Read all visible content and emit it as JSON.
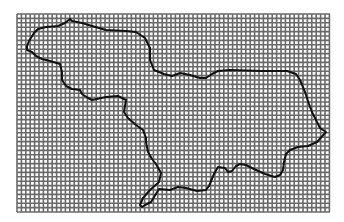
{
  "map": {
    "grid": {
      "x": 17,
      "y": 14,
      "width": 313,
      "height": 198,
      "cell": 4.4,
      "background": "#ffffff",
      "line_color": "#6a6a6a"
    },
    "region_outline": {
      "stroke": "#111111",
      "stroke_width": 2,
      "points": [
        [
          70,
          19
        ],
        [
          72,
          21
        ],
        [
          82,
          23
        ],
        [
          92,
          26
        ],
        [
          106,
          30
        ],
        [
          126,
          31
        ],
        [
          136,
          32
        ],
        [
          145,
          38
        ],
        [
          150,
          48
        ],
        [
          150,
          60
        ],
        [
          154,
          70
        ],
        [
          164,
          74
        ],
        [
          172,
          76
        ],
        [
          180,
          73
        ],
        [
          190,
          75
        ],
        [
          200,
          78
        ],
        [
          206,
          78
        ],
        [
          212,
          74
        ],
        [
          218,
          71
        ],
        [
          230,
          70
        ],
        [
          262,
          71
        ],
        [
          287,
          71
        ],
        [
          296,
          74
        ],
        [
          300,
          80
        ],
        [
          305,
          92
        ],
        [
          309,
          104
        ],
        [
          312,
          112
        ],
        [
          320,
          128
        ],
        [
          326,
          132
        ],
        [
          317,
          142
        ],
        [
          308,
          146
        ],
        [
          298,
          147
        ],
        [
          290,
          150
        ],
        [
          286,
          154
        ],
        [
          284,
          162
        ],
        [
          283,
          170
        ],
        [
          280,
          175
        ],
        [
          275,
          177
        ],
        [
          265,
          174
        ],
        [
          254,
          169
        ],
        [
          246,
          165
        ],
        [
          240,
          164
        ],
        [
          236,
          166
        ],
        [
          232,
          171
        ],
        [
          228,
          172
        ],
        [
          225,
          168
        ],
        [
          218,
          167
        ],
        [
          214,
          174
        ],
        [
          209,
          186
        ],
        [
          206,
          190
        ],
        [
          197,
          191
        ],
        [
          186,
          188
        ],
        [
          178,
          187
        ],
        [
          170,
          190
        ],
        [
          159,
          189
        ],
        [
          151,
          202
        ],
        [
          145,
          205
        ],
        [
          142,
          207
        ],
        [
          140,
          205
        ],
        [
          143,
          198
        ],
        [
          150,
          190
        ],
        [
          159,
          182
        ],
        [
          161,
          173
        ],
        [
          156,
          164
        ],
        [
          152,
          159
        ],
        [
          148,
          152
        ],
        [
          146,
          142
        ],
        [
          146,
          138
        ],
        [
          143,
          130
        ],
        [
          136,
          125
        ],
        [
          128,
          118
        ],
        [
          124,
          112
        ],
        [
          126,
          100
        ],
        [
          118,
          96
        ],
        [
          106,
          97
        ],
        [
          92,
          100
        ],
        [
          88,
          98
        ],
        [
          82,
          94
        ],
        [
          80,
          90
        ],
        [
          72,
          89
        ],
        [
          66,
          86
        ],
        [
          62,
          80
        ],
        [
          62,
          72
        ],
        [
          60,
          64
        ],
        [
          50,
          61
        ],
        [
          42,
          59
        ],
        [
          36,
          56
        ],
        [
          32,
          52
        ],
        [
          27,
          50
        ],
        [
          27,
          46
        ],
        [
          29,
          41
        ],
        [
          34,
          33
        ],
        [
          38,
          29
        ],
        [
          46,
          27
        ],
        [
          58,
          26
        ],
        [
          65,
          23
        ],
        [
          70,
          19
        ]
      ]
    }
  }
}
